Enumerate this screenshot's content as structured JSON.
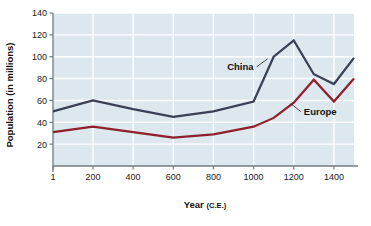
{
  "chart_data": {
    "type": "line",
    "title": "",
    "xlabel": "Year (C.E.)",
    "ylabel": "Population (in millions)",
    "xlabel_main": "Year",
    "xlabel_suffix": "(C.E.)",
    "xlim": [
      1,
      1500
    ],
    "ylim": [
      0,
      140
    ],
    "grid": true,
    "legend_position": "inline-annotations",
    "x_ticks": [
      1,
      200,
      400,
      600,
      800,
      1000,
      1200,
      1400
    ],
    "x_tick_labels": [
      "1",
      "200",
      "400",
      "600",
      "800",
      "1000",
      "1200",
      "1400"
    ],
    "y_ticks": [
      20,
      40,
      60,
      80,
      100,
      120,
      140
    ],
    "y_tick_labels": [
      "20",
      "40",
      "60",
      "80",
      "100",
      "120",
      "140"
    ],
    "x": [
      1,
      200,
      400,
      600,
      800,
      1000,
      1100,
      1200,
      1300,
      1400,
      1500
    ],
    "series": [
      {
        "name": "China",
        "color": "#3a3f55",
        "values": [
          50,
          60,
          52,
          45,
          50,
          59,
          100,
          115,
          84,
          75,
          99
        ],
        "label_x": 1000,
        "label_y": 88
      },
      {
        "name": "Europe",
        "color": "#8e1f2b",
        "values": [
          31,
          36,
          31,
          26,
          29,
          36,
          44,
          58,
          79,
          59,
          80
        ],
        "label_x": 1250,
        "label_y": 47
      }
    ],
    "plot_background": "#dce8ee",
    "gridline_color": "#ffffff",
    "axis_color": "#6f7b80"
  }
}
